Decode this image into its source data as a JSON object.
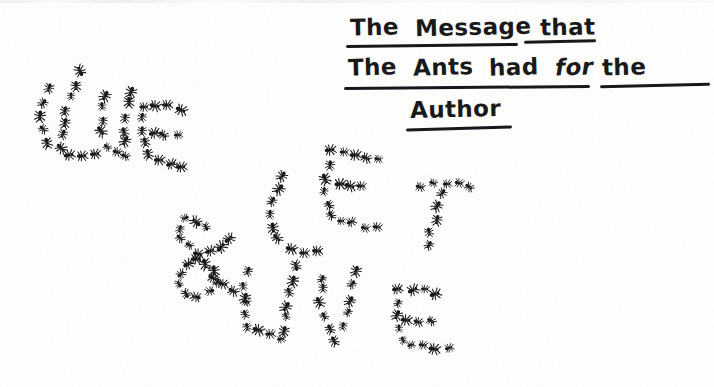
{
  "image": {
    "kind": "scanned-handwritten-illustration",
    "width": 714,
    "height": 387,
    "background_color": "#fdfdfc",
    "ink_color": "#141414"
  },
  "caption": {
    "full_text": "The Message that The Ants had for the Author",
    "underlined": true,
    "lines": [
      {
        "id": "line1",
        "words": [
          "The",
          "Message",
          "that"
        ]
      },
      {
        "id": "line2",
        "words": [
          "The",
          "Ants",
          "had",
          "for",
          "the"
        ]
      },
      {
        "id": "line3",
        "words": [
          "Author"
        ]
      }
    ],
    "line1_w1": "The",
    "line1_w2": "Message",
    "line1_w3": "that",
    "line2_w1": "The",
    "line2_w2": "Ants",
    "line2_w3": "had",
    "line2_w4": "for",
    "line2_w5": "the",
    "line3_w1": "Author"
  },
  "artwork": {
    "title": "LIVE & LET LIVE",
    "description": "Letters formed from many individual ants arranged along stroke paths",
    "message_words": [
      "LIVE",
      "&",
      "LET",
      "LIVE"
    ],
    "ant_color": "#141414",
    "ant_count": 196,
    "letters": [
      {
        "glyph": "L",
        "word_index": 0
      },
      {
        "glyph": "I",
        "word_index": 0
      },
      {
        "glyph": "V",
        "word_index": 0
      },
      {
        "glyph": "E",
        "word_index": 0
      },
      {
        "glyph": "&",
        "word_index": 1
      },
      {
        "glyph": "L",
        "word_index": 2
      },
      {
        "glyph": "E",
        "word_index": 2
      },
      {
        "glyph": "T",
        "word_index": 2
      },
      {
        "glyph": "L",
        "word_index": 3
      },
      {
        "glyph": "I",
        "word_index": 3
      },
      {
        "glyph": "V",
        "word_index": 3
      },
      {
        "glyph": "E",
        "word_index": 3
      }
    ],
    "ant_paths": [
      {
        "name": "L1-stem",
        "pts": [
          [
            46,
            88
          ],
          [
            42,
            101
          ],
          [
            40,
            114
          ],
          [
            42,
            127
          ],
          [
            48,
            140
          ],
          [
            58,
            148
          ]
        ]
      },
      {
        "name": "L1-foot",
        "pts": [
          [
            70,
            152
          ],
          [
            82,
            154
          ],
          [
            94,
            153
          ]
        ]
      },
      {
        "name": "I1-stem",
        "pts": [
          [
            75,
            83
          ],
          [
            70,
            96
          ],
          [
            66,
            109
          ],
          [
            63,
            122
          ],
          [
            60,
            135
          ]
        ]
      },
      {
        "name": "I1-dot",
        "pts": [
          [
            80,
            70
          ]
        ]
      },
      {
        "name": "V1-left",
        "pts": [
          [
            104,
            93
          ],
          [
            101,
            106
          ],
          [
            100,
            119
          ],
          [
            102,
            132
          ],
          [
            108,
            145
          ]
        ]
      },
      {
        "name": "V1-right",
        "pts": [
          [
            128,
            90
          ],
          [
            127,
            103
          ],
          [
            126,
            116
          ],
          [
            125,
            129
          ],
          [
            124,
            142
          ]
        ]
      },
      {
        "name": "V1-base",
        "pts": [
          [
            114,
            152
          ],
          [
            126,
            154
          ]
        ]
      },
      {
        "name": "E1-top",
        "pts": [
          [
            144,
            104
          ],
          [
            156,
            104
          ],
          [
            168,
            105
          ],
          [
            180,
            107
          ]
        ]
      },
      {
        "name": "E1-stem",
        "pts": [
          [
            142,
            116
          ],
          [
            141,
            129
          ],
          [
            142,
            142
          ],
          [
            146,
            155
          ]
        ]
      },
      {
        "name": "E1-mid",
        "pts": [
          [
            152,
            131
          ],
          [
            164,
            133
          ],
          [
            176,
            135
          ]
        ]
      },
      {
        "name": "E1-bot",
        "pts": [
          [
            156,
            160
          ],
          [
            168,
            162
          ],
          [
            180,
            164
          ]
        ]
      },
      {
        "name": "AMP-loop",
        "pts": [
          [
            205,
            227
          ],
          [
            196,
            219
          ],
          [
            185,
            218
          ],
          [
            178,
            226
          ],
          [
            179,
            237
          ],
          [
            187,
            246
          ],
          [
            197,
            253
          ],
          [
            206,
            261
          ],
          [
            213,
            271
          ],
          [
            214,
            283
          ],
          [
            207,
            292
          ],
          [
            195,
            295
          ],
          [
            183,
            292
          ],
          [
            176,
            282
          ],
          [
            178,
            271
          ],
          [
            186,
            263
          ],
          [
            197,
            257
          ],
          [
            209,
            251
          ],
          [
            220,
            244
          ],
          [
            229,
            236
          ]
        ]
      },
      {
        "name": "AMP-tail",
        "pts": [
          [
            212,
            278
          ],
          [
            223,
            285
          ],
          [
            234,
            292
          ],
          [
            245,
            299
          ]
        ]
      },
      {
        "name": "L2-stem",
        "pts": [
          [
            282,
            175
          ],
          [
            276,
            188
          ],
          [
            272,
            201
          ],
          [
            270,
            214
          ],
          [
            272,
            227
          ],
          [
            278,
            239
          ]
        ]
      },
      {
        "name": "L2-foot",
        "pts": [
          [
            290,
            247
          ],
          [
            302,
            250
          ],
          [
            314,
            251
          ]
        ]
      },
      {
        "name": "E2-top",
        "pts": [
          [
            330,
            150
          ],
          [
            342,
            151
          ],
          [
            354,
            153
          ],
          [
            366,
            155
          ],
          [
            378,
            157
          ]
        ]
      },
      {
        "name": "E2-stem",
        "pts": [
          [
            327,
            164
          ],
          [
            325,
            177
          ],
          [
            325,
            190
          ],
          [
            327,
            203
          ],
          [
            332,
            216
          ]
        ]
      },
      {
        "name": "E2-mid",
        "pts": [
          [
            338,
            182
          ],
          [
            350,
            184
          ],
          [
            362,
            186
          ]
        ]
      },
      {
        "name": "E2-bot",
        "pts": [
          [
            340,
            221
          ],
          [
            352,
            223
          ],
          [
            364,
            225
          ],
          [
            376,
            226
          ]
        ]
      },
      {
        "name": "T2-bar",
        "pts": [
          [
            420,
            184
          ],
          [
            432,
            182
          ],
          [
            444,
            181
          ],
          [
            456,
            182
          ],
          [
            468,
            185
          ]
        ]
      },
      {
        "name": "T2-stem",
        "pts": [
          [
            442,
            192
          ],
          [
            438,
            205
          ],
          [
            434,
            218
          ],
          [
            430,
            231
          ],
          [
            427,
            244
          ]
        ]
      },
      {
        "name": "L3-stem",
        "pts": [
          [
            248,
            272
          ],
          [
            244,
            285
          ],
          [
            242,
            298
          ],
          [
            243,
            311
          ],
          [
            248,
            324
          ]
        ]
      },
      {
        "name": "L3-foot",
        "pts": [
          [
            258,
            331
          ],
          [
            270,
            334
          ],
          [
            282,
            336
          ]
        ]
      },
      {
        "name": "I3-stem",
        "pts": [
          [
            290,
            278
          ],
          [
            287,
            291
          ],
          [
            285,
            304
          ],
          [
            284,
            317
          ],
          [
            284,
            330
          ]
        ]
      },
      {
        "name": "I3-dot",
        "pts": [
          [
            296,
            264
          ]
        ]
      },
      {
        "name": "V3-left",
        "pts": [
          [
            322,
            276
          ],
          [
            320,
            289
          ],
          [
            320,
            302
          ],
          [
            322,
            315
          ],
          [
            327,
            328
          ],
          [
            334,
            339
          ]
        ]
      },
      {
        "name": "V3-right",
        "pts": [
          [
            356,
            272
          ],
          [
            353,
            285
          ],
          [
            350,
            298
          ],
          [
            347,
            311
          ],
          [
            344,
            324
          ]
        ]
      },
      {
        "name": "E3-top",
        "pts": [
          [
            398,
            289
          ],
          [
            410,
            288
          ],
          [
            422,
            289
          ],
          [
            434,
            291
          ]
        ]
      },
      {
        "name": "E3-stem",
        "pts": [
          [
            396,
            301
          ],
          [
            395,
            314
          ],
          [
            397,
            327
          ],
          [
            402,
            339
          ]
        ]
      },
      {
        "name": "E3-mid",
        "pts": [
          [
            406,
            318
          ],
          [
            418,
            319
          ],
          [
            430,
            320
          ]
        ]
      },
      {
        "name": "E3-bot",
        "pts": [
          [
            410,
            344
          ],
          [
            422,
            346
          ],
          [
            434,
            347
          ],
          [
            446,
            347
          ]
        ]
      }
    ]
  }
}
